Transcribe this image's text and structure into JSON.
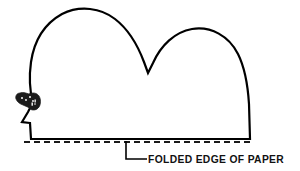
{
  "figure": {
    "background_color": "#ffffff",
    "ink_color": "#000000",
    "caption": {
      "label": "FOLDED EDGE OF PAPER",
      "position": "bottom-right",
      "style": "bold-uppercase"
    },
    "annotation": {
      "leader_line_name": "elbow leader",
      "points_to": "dashed fold line"
    },
    "elements": [
      {
        "name": "body-outline",
        "description": "Two-hump closed outline with pointed snout at lower left"
      },
      {
        "name": "fold-line",
        "description": "Horizontal dashed line along the bottom of the shape"
      },
      {
        "name": "tail-detail",
        "description": "Small dark speckled detail near the left edge"
      }
    ],
    "geometry": {
      "outline_path": "M 30 123 L 22 122 L 28 112 L 30 108 L 33 104 C 30 92 29 76 31 62 C 34 42 44 24 62 14 C 80 5 101 8 115 19 C 128 29 138 46 144 62 L 148 73 L 153 63 C 161 45 175 32 192 29 C 211 26 229 36 238 54 C 245 68 248 88 249 104 L 250 139 L 31 139 Z",
      "fold_line": "M 24 142 L 252 142",
      "leader_line": "M 126 141 L 126 159 L 147 159",
      "caption_anchor": {
        "x": 148,
        "y": 162
      }
    }
  }
}
